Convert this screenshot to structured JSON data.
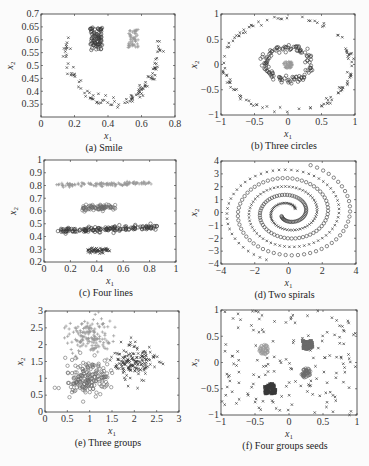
{
  "figure": {
    "background": "#fbfbfb",
    "colors": {
      "dark": "#3a3a3a",
      "mid": "#6a6a6a",
      "light": "#9a9a9a",
      "frame": "#333333"
    }
  },
  "chart_data": [
    {
      "id": "a",
      "type": "scatter",
      "caption": "(a) Smile",
      "frame": [
        41,
        14,
        175,
        117
      ],
      "xlim": [
        0,
        0.8
      ],
      "ylim": [
        0.3,
        0.7
      ],
      "xticks": [
        0,
        0.2,
        0.4,
        0.6,
        0.8
      ],
      "yticks": [
        0.35,
        0.4,
        0.45,
        0.5,
        0.55,
        0.6,
        0.65,
        0.7
      ],
      "xlabel": "x1",
      "ylabel": "x2",
      "series": [
        {
          "name": "left eye",
          "marker": "o",
          "color": "dark",
          "shape": "box",
          "cx": 0.33,
          "cy": 0.605,
          "w": 0.07,
          "h": 0.09,
          "n": 80
        },
        {
          "name": "right eye",
          "marker": "+",
          "color": "light",
          "shape": "box",
          "cx": 0.55,
          "cy": 0.605,
          "w": 0.06,
          "h": 0.07,
          "n": 50
        },
        {
          "name": "mouth",
          "marker": "x",
          "color": "dark",
          "shape": "arc",
          "cx": 0.43,
          "cy": 0.6,
          "rx": 0.28,
          "ry": 0.25,
          "a0": 180,
          "a1": 360,
          "noise": 0.012,
          "n": 110
        }
      ]
    },
    {
      "id": "b",
      "type": "scatter",
      "caption": "(b) Three circles",
      "frame": [
        221,
        14,
        355,
        115
      ],
      "xlim": [
        -1,
        1
      ],
      "ylim": [
        -1,
        1
      ],
      "xticks": [
        -1,
        -0.5,
        0,
        0.5,
        1
      ],
      "yticks": [
        -1,
        -0.5,
        0,
        0.5,
        1
      ],
      "xlabel": "x1",
      "ylabel": "x2",
      "series": [
        {
          "name": "outer circle",
          "marker": "x",
          "color": "dark",
          "shape": "arc",
          "cx": 0,
          "cy": 0,
          "rx": 0.95,
          "ry": 0.93,
          "a0": 0,
          "a1": 360,
          "noise": 0.025,
          "n": 110
        },
        {
          "name": "middle ring",
          "marker": "o",
          "color": "dark",
          "shape": "ring",
          "cx": 0,
          "cy": 0.02,
          "rx": 0.33,
          "ry": 0.32,
          "noise": 0.06,
          "n": 120
        },
        {
          "name": "center blob",
          "marker": "+",
          "color": "light",
          "shape": "disk",
          "cx": 0,
          "cy": 0,
          "rx": 0.07,
          "ry": 0.08,
          "n": 40
        }
      ]
    },
    {
      "id": "c",
      "type": "scatter",
      "caption": "(c) Four lines",
      "frame": [
        44,
        160,
        176,
        262
      ],
      "xlim": [
        0,
        1
      ],
      "ylim": [
        0.2,
        1
      ],
      "xticks": [
        0,
        0.2,
        0.4,
        0.6,
        0.8,
        1
      ],
      "yticks": [
        0.2,
        0.3,
        0.4,
        0.5,
        0.6,
        0.7,
        0.8,
        0.9,
        1
      ],
      "xlabel": "x1",
      "ylabel": "x2",
      "series": [
        {
          "name": "top line",
          "marker": "+",
          "color": "light",
          "shape": "line",
          "x0": 0.08,
          "x1": 0.82,
          "y0": 0.805,
          "y1": 0.815,
          "noise": 0.008,
          "n": 120
        },
        {
          "name": "short line upper",
          "marker": "o",
          "color": "mid",
          "shape": "line",
          "x0": 0.29,
          "x1": 0.54,
          "y0": 0.625,
          "y1": 0.63,
          "noise": 0.012,
          "n": 70
        },
        {
          "name": "long line",
          "marker": "o",
          "color": "dark",
          "shape": "line",
          "x0": 0.1,
          "x1": 0.86,
          "y0": 0.445,
          "y1": 0.47,
          "noise": 0.01,
          "n": 150
        },
        {
          "name": "short line lower",
          "marker": "x",
          "color": "dark",
          "shape": "line",
          "x0": 0.33,
          "x1": 0.5,
          "y0": 0.29,
          "y1": 0.29,
          "noise": 0.01,
          "n": 60
        }
      ]
    },
    {
      "id": "d",
      "type": "scatter",
      "caption": "(d) Two spirals",
      "frame": [
        221,
        161,
        356,
        264
      ],
      "xlim": [
        -4,
        4
      ],
      "ylim": [
        -4,
        4
      ],
      "xticks": [
        -4,
        -2,
        0,
        2,
        4
      ],
      "yticks": [
        -4,
        -3,
        -2,
        -1,
        0,
        1,
        2,
        3,
        4
      ],
      "xlabel": "x1",
      "ylabel": "x2",
      "series": [
        {
          "name": "spiral 1",
          "marker": "x",
          "color": "dark",
          "shape": "spiral",
          "phase": 0,
          "turns": 2.6,
          "rmax": 3.9,
          "n": 150
        },
        {
          "name": "spiral 2",
          "marker": "o",
          "color": "dark",
          "shape": "spiral",
          "phase": 180,
          "turns": 2.6,
          "rmax": 3.9,
          "n": 150
        }
      ]
    },
    {
      "id": "e",
      "type": "scatter",
      "caption": "(e) Three groups",
      "frame": [
        45,
        311,
        179,
        412
      ],
      "xlim": [
        0,
        3
      ],
      "ylim": [
        0,
        3
      ],
      "xticks": [
        0,
        0.5,
        1,
        1.5,
        2,
        2.5,
        3
      ],
      "yticks": [
        0,
        0.5,
        1,
        1.5,
        2,
        2.5,
        3
      ],
      "xlabel": "x1",
      "ylabel": "x2",
      "series": [
        {
          "name": "group 1",
          "marker": "+",
          "color": "light",
          "shape": "gauss",
          "cx": 1.0,
          "cy": 2.25,
          "sx": 0.25,
          "sy": 0.25,
          "n": 150
        },
        {
          "name": "group 2",
          "marker": "o",
          "color": "mid",
          "shape": "gauss",
          "cx": 0.95,
          "cy": 1.0,
          "sx": 0.25,
          "sy": 0.25,
          "n": 170
        },
        {
          "name": "group 3",
          "marker": "x",
          "color": "dark",
          "shape": "gauss",
          "cx": 2.0,
          "cy": 1.5,
          "sx": 0.22,
          "sy": 0.25,
          "n": 160
        }
      ]
    },
    {
      "id": "f",
      "type": "scatter",
      "caption": "(f) Four groups seeds",
      "frame": [
        221,
        310,
        357,
        415
      ],
      "xlim": [
        -1,
        1
      ],
      "ylim": [
        -1,
        1
      ],
      "xticks": [
        -1,
        -0.5,
        0,
        0.5,
        1
      ],
      "yticks": [
        -1,
        -0.5,
        0,
        0.5,
        1
      ],
      "xlabel": "x1",
      "ylabel": "x2",
      "series": [
        {
          "name": "noise",
          "marker": "x",
          "color": "dark",
          "shape": "uniform",
          "n": 150
        },
        {
          "name": "seed group 1",
          "marker": "o",
          "color": "light",
          "shape": "disk",
          "cx": -0.37,
          "cy": 0.25,
          "rx": 0.07,
          "ry": 0.09,
          "n": 40
        },
        {
          "name": "seed group 2",
          "marker": "s",
          "color": "mid",
          "shape": "box",
          "cx": 0.27,
          "cy": 0.33,
          "w": 0.15,
          "h": 0.17,
          "n": 40
        },
        {
          "name": "seed group 3",
          "marker": "o",
          "color": "mid",
          "shape": "disk",
          "cx": 0.25,
          "cy": -0.2,
          "rx": 0.07,
          "ry": 0.09,
          "n": 40
        },
        {
          "name": "seed group 4",
          "marker": "s",
          "color": "dark",
          "shape": "box",
          "cx": -0.28,
          "cy": -0.5,
          "w": 0.17,
          "h": 0.18,
          "n": 40
        }
      ]
    }
  ]
}
